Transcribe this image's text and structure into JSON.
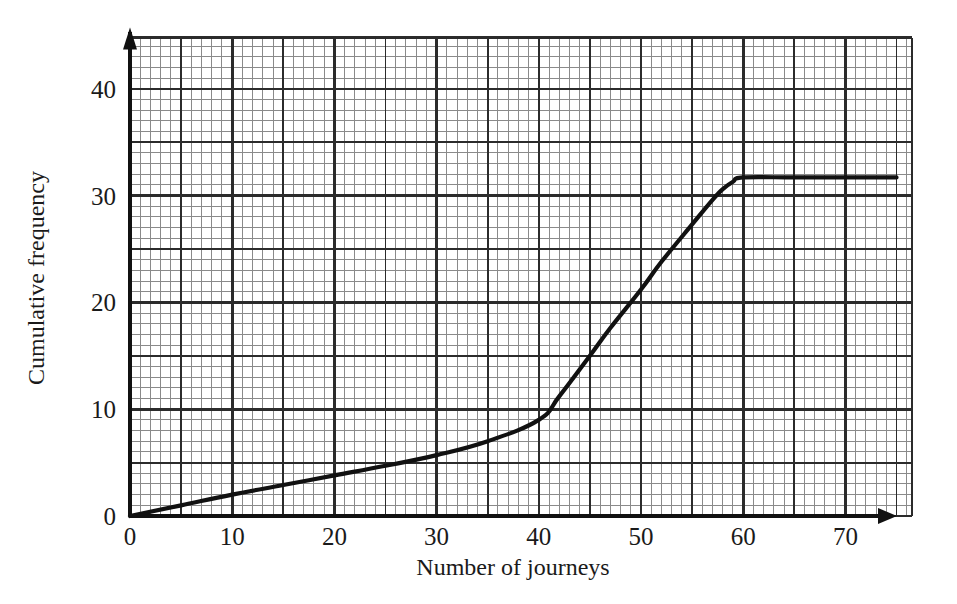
{
  "chart_data": {
    "type": "line",
    "title": "",
    "subtitle": "",
    "xlabel": "Number of journeys",
    "ylabel": "Cumulative frequency",
    "xlim": [
      0,
      75
    ],
    "ylim": [
      0,
      44.8
    ],
    "grid": true,
    "grid_minor_step_x": 1,
    "grid_minor_step_y": 1,
    "grid_major_step_x": 5,
    "grid_major_step_y": 5,
    "legend": "none",
    "xticks": [
      0,
      10,
      20,
      30,
      40,
      50,
      60,
      70
    ],
    "xtick_labels": [
      "0",
      "10",
      "20",
      "30",
      "40",
      "50",
      "60",
      "70"
    ],
    "yticks": [
      0,
      10,
      20,
      30,
      40
    ],
    "ytick_labels": [
      "0",
      "10",
      "20",
      "30",
      "40"
    ],
    "series": [
      {
        "name": "Cumulative frequency",
        "color": "#111111",
        "x": [
          0,
          5,
          10,
          15,
          20,
          25,
          30,
          35,
          40,
          42,
          45,
          47,
          50,
          52,
          55,
          57,
          58,
          59,
          60,
          65,
          70,
          75
        ],
        "values": [
          0,
          1.0,
          2.0,
          2.9,
          3.8,
          4.7,
          5.7,
          7.0,
          9.0,
          11.2,
          15.0,
          17.6,
          21.2,
          23.8,
          27.3,
          29.6,
          30.6,
          31.3,
          31.7,
          31.7,
          31.7,
          31.7
        ]
      }
    ],
    "annotations": []
  },
  "colors": {
    "background": "#ffffff",
    "grid_minor": "#8a8a8a",
    "grid_major": "#2b2b2b",
    "axis": "#111111",
    "curve": "#111111",
    "text": "#1a1a1a"
  },
  "axes": {
    "x_axis_label": "Number of journeys",
    "y_axis_label": "Cumulative frequency",
    "x_labels": [
      "0",
      "10",
      "20",
      "30",
      "40",
      "50",
      "60",
      "70"
    ],
    "y_labels": [
      "0",
      "10",
      "20",
      "30",
      "40"
    ]
  }
}
